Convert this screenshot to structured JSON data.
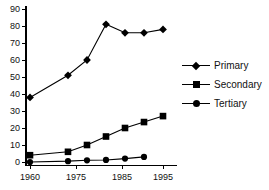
{
  "chart_data": {
    "type": "line",
    "title": "",
    "xlabel": "",
    "ylabel": "",
    "x": [
      1960,
      1970,
      1975,
      1980,
      1985,
      1990,
      1995
    ],
    "categories": [
      "1960",
      "1970",
      "1975",
      "1980",
      "1985",
      "1990",
      "1995"
    ],
    "series": [
      {
        "name": "Primary",
        "marker": "diamond",
        "values": [
          38,
          51,
          60,
          81,
          76,
          76,
          78
        ]
      },
      {
        "name": "Secondary",
        "marker": "square",
        "values": [
          4,
          6,
          10,
          15,
          20,
          23.5,
          27
        ]
      },
      {
        "name": "Tertiary",
        "marker": "circle",
        "values": [
          0,
          0.5,
          1,
          1.2,
          2,
          3,
          null
        ]
      }
    ],
    "xlim": [
      1958,
      1997
    ],
    "ylim": [
      0,
      90
    ],
    "yticks": [
      0,
      10,
      20,
      30,
      40,
      50,
      60,
      70,
      80,
      90
    ],
    "ytick_labels": [
      "0",
      "10",
      "20",
      "30",
      "40",
      "50",
      "60",
      "70",
      "80",
      "90"
    ],
    "xticks": [
      1960,
      1975,
      1985,
      1995
    ],
    "xtick_labels": [
      "1960",
      "1975",
      "1985",
      "1995"
    ],
    "grid": false,
    "legend_position": "right",
    "line_color": "#000000",
    "axis_color": "#000000",
    "background_color": "#ffffff"
  },
  "legend": {
    "entries": [
      {
        "label": "Primary",
        "icon": "diamond-marker-icon"
      },
      {
        "label": "Secondary",
        "icon": "square-marker-icon"
      },
      {
        "label": "Tertiary",
        "icon": "circle-marker-icon"
      }
    ]
  }
}
